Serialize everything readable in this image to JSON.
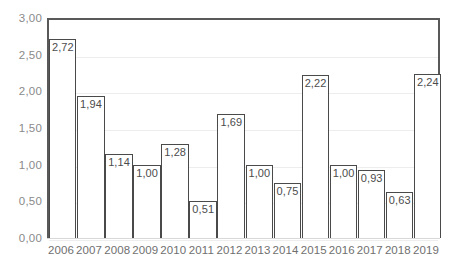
{
  "chart_data": {
    "type": "bar",
    "title": "",
    "subtitle": "",
    "xlabel": "",
    "ylabel": "",
    "categories": [
      "2006",
      "2007",
      "2008",
      "2009",
      "2010",
      "2011",
      "2012",
      "2013",
      "2014",
      "2015",
      "2016",
      "2017",
      "2018",
      "2019"
    ],
    "values": [
      2.72,
      1.94,
      1.14,
      1.0,
      1.28,
      0.51,
      1.69,
      1.0,
      0.75,
      2.22,
      1.0,
      0.93,
      0.63,
      2.24
    ],
    "value_labels": [
      "2,72",
      "1,94",
      "1,14",
      "1,00",
      "1,28",
      "0,51",
      "1,69",
      "1,00",
      "0,75",
      "2,22",
      "1,00",
      "0,93",
      "0,63",
      "2,24"
    ],
    "ylim": [
      0,
      3
    ],
    "ytick_values": [
      0,
      0.5,
      1,
      1.5,
      2,
      2.5,
      3
    ],
    "ytick_labels": [
      "0,00",
      "0,50",
      "1,00",
      "1,50",
      "2,00",
      "2,50",
      "3,00"
    ],
    "grid": true,
    "legend": "none",
    "decimal_separator": ",",
    "colors": {
      "bar_fill": "#ffffff",
      "bar_border": "#4a4a4a",
      "gridline": "#ededed",
      "plot_border": "#595959",
      "tick_label": "#7c7c7c",
      "data_label": "#4c4c4c",
      "background": "#ffffff"
    }
  }
}
